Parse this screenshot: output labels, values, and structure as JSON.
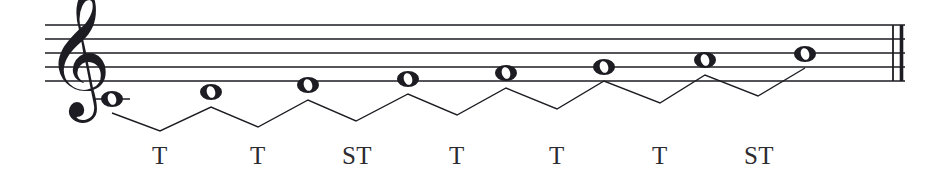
{
  "figure": {
    "kind": "music-notation-staff",
    "clef": "treble-clef",
    "barline": "final-double-barline",
    "ink_color": "#1c1c22",
    "paper_color": "#ffffff",
    "staff": {
      "line_count": 5,
      "left_x": 45,
      "right_x": 905,
      "line_y": [
        25,
        39,
        53,
        67,
        81
      ],
      "line_thickness": 1.6
    },
    "clef_glyph": "𝄞",
    "notes": [
      {
        "index": 1,
        "glyph": "𝅝",
        "x": 112,
        "y": 99,
        "ledger": true,
        "head_rx": 11,
        "head_ry": 8
      },
      {
        "index": 2,
        "glyph": "𝅝",
        "x": 211,
        "y": 92,
        "ledger": false,
        "head_rx": 11,
        "head_ry": 8
      },
      {
        "index": 3,
        "glyph": "𝅝",
        "x": 308,
        "y": 85,
        "ledger": false,
        "head_rx": 11,
        "head_ry": 8
      },
      {
        "index": 4,
        "glyph": "𝅝",
        "x": 408,
        "y": 79,
        "ledger": false,
        "head_rx": 11,
        "head_ry": 8
      },
      {
        "index": 5,
        "glyph": "𝅝",
        "x": 506,
        "y": 73,
        "ledger": false,
        "head_rx": 11,
        "head_ry": 8
      },
      {
        "index": 6,
        "glyph": "𝅝",
        "x": 604,
        "y": 67,
        "ledger": false,
        "head_rx": 11,
        "head_ry": 8
      },
      {
        "index": 7,
        "glyph": "𝅝",
        "x": 705,
        "y": 60,
        "ledger": false,
        "head_rx": 11,
        "head_ry": 8
      },
      {
        "index": 8,
        "glyph": "𝅝",
        "x": 805,
        "y": 54,
        "ledger": false,
        "head_rx": 11,
        "head_ry": 8
      }
    ],
    "bracket_polyline": "112,113 160,131 211,107 258,127 308,100 356,121 408,94 457,115 506,88 557,109 604,81 660,103 705,75 758,96 805,68",
    "interval_labels": [
      {
        "index": 1,
        "text": "T",
        "x": 160,
        "y": 156
      },
      {
        "index": 2,
        "text": "T",
        "x": 258,
        "y": 156
      },
      {
        "index": 3,
        "text": "ST",
        "x": 357,
        "y": 156
      },
      {
        "index": 4,
        "text": "T",
        "x": 457,
        "y": 156
      },
      {
        "index": 5,
        "text": "T",
        "x": 557,
        "y": 156
      },
      {
        "index": 6,
        "text": "T",
        "x": 660,
        "y": 156
      },
      {
        "index": 7,
        "text": "ST",
        "x": 759,
        "y": 156
      }
    ]
  }
}
